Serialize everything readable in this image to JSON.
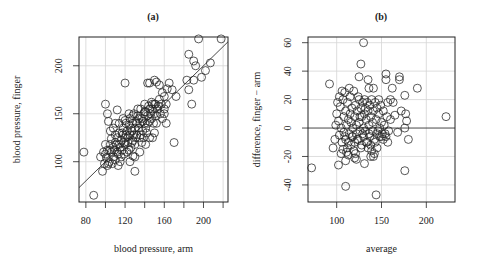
{
  "chart_data": [
    {
      "type": "scatter",
      "title": "(a)",
      "xlabel": "blood pressure, arm",
      "ylabel": "blood pressure, finger",
      "xlim": [
        73,
        225
      ],
      "ylim": [
        58,
        230
      ],
      "xticks": [
        80,
        120,
        160,
        200
      ],
      "xgrid": [
        80,
        100,
        120,
        140,
        160,
        180,
        200,
        220
      ],
      "yticks": [
        100,
        150,
        200
      ],
      "ygrid": [
        100,
        150,
        200
      ],
      "grid": true,
      "reference_line": {
        "type": "identity",
        "slope": 1.0,
        "intercept": 0
      },
      "points": [
        [
          88,
          65
        ],
        [
          78,
          110
        ],
        [
          100,
          160
        ],
        [
          102,
          150
        ],
        [
          103,
          142
        ],
        [
          112,
          154
        ],
        [
          120,
          182
        ],
        [
          143,
          182
        ],
        [
          145,
          182
        ],
        [
          150,
          185
        ],
        [
          152,
          183
        ],
        [
          155,
          180
        ],
        [
          158,
          172
        ],
        [
          160,
          168
        ],
        [
          163,
          176
        ],
        [
          168,
          175
        ],
        [
          165,
          182
        ],
        [
          172,
          168
        ],
        [
          185,
          212
        ],
        [
          190,
          205
        ],
        [
          192,
          200
        ],
        [
          195,
          228
        ],
        [
          207,
          203
        ],
        [
          202,
          195
        ],
        [
          218,
          228
        ],
        [
          198,
          188
        ],
        [
          190,
          185
        ],
        [
          185,
          175
        ],
        [
          183,
          185
        ],
        [
          188,
          160
        ],
        [
          170,
          120
        ],
        [
          130,
          90
        ],
        [
          97,
          90
        ],
        [
          102,
          96
        ],
        [
          113,
          96
        ],
        [
          95,
          105
        ],
        [
          98,
          110
        ],
        [
          100,
          108
        ],
        [
          100,
          118
        ],
        [
          102,
          112
        ],
        [
          104,
          100
        ],
        [
          105,
          118
        ],
        [
          106,
          124
        ],
        [
          108,
          105
        ],
        [
          108,
          115
        ],
        [
          110,
          120
        ],
        [
          110,
          102
        ],
        [
          112,
          110
        ],
        [
          112,
          125
        ],
        [
          114,
          118
        ],
        [
          114,
          130
        ],
        [
          115,
          100
        ],
        [
          116,
          122
        ],
        [
          117,
          112
        ],
        [
          118,
          128
        ],
        [
          118,
          135
        ],
        [
          120,
          118
        ],
        [
          120,
          125
        ],
        [
          121,
          140
        ],
        [
          122,
          110
        ],
        [
          122,
          132
        ],
        [
          123,
          120
        ],
        [
          124,
          138
        ],
        [
          125,
          128
        ],
        [
          125,
          145
        ],
        [
          126,
          115
        ],
        [
          127,
          132
        ],
        [
          128,
          140
        ],
        [
          128,
          122
        ],
        [
          129,
          150
        ],
        [
          130,
          135
        ],
        [
          130,
          118
        ],
        [
          131,
          142
        ],
        [
          132,
          128
        ],
        [
          133,
          148
        ],
        [
          134,
          135
        ],
        [
          135,
          140
        ],
        [
          135,
          125
        ],
        [
          136,
          155
        ],
        [
          137,
          145
        ],
        [
          138,
          132
        ],
        [
          139,
          150
        ],
        [
          140,
          140
        ],
        [
          140,
          160
        ],
        [
          141,
          152
        ],
        [
          142,
          130
        ],
        [
          143,
          148
        ],
        [
          144,
          158
        ],
        [
          145,
          142
        ],
        [
          146,
          150
        ],
        [
          147,
          162
        ],
        [
          148,
          155
        ],
        [
          149,
          140
        ],
        [
          150,
          150
        ],
        [
          151,
          160
        ],
        [
          152,
          148
        ],
        [
          154,
          158
        ],
        [
          155,
          165
        ],
        [
          156,
          150
        ],
        [
          157,
          160
        ],
        [
          160,
          155
        ],
        [
          162,
          160
        ],
        [
          99,
          98
        ],
        [
          101,
          104
        ],
        [
          103,
          98
        ],
        [
          104,
          112
        ],
        [
          106,
          110
        ],
        [
          107,
          98
        ],
        [
          109,
          112
        ],
        [
          110,
          128
        ],
        [
          111,
          118
        ],
        [
          113,
          108
        ],
        [
          115,
          115
        ],
        [
          116,
          105
        ],
        [
          117,
          130
        ],
        [
          119,
          120
        ],
        [
          119,
          108
        ],
        [
          121,
          128
        ],
        [
          123,
          126
        ],
        [
          124,
          112
        ],
        [
          126,
          135
        ],
        [
          127,
          120
        ],
        [
          129,
          128
        ],
        [
          131,
          125
        ],
        [
          132,
          140
        ],
        [
          134,
          145
        ],
        [
          136,
          128
        ],
        [
          138,
          142
        ],
        [
          139,
          125
        ],
        [
          141,
          135
        ],
        [
          143,
          140
        ],
        [
          145,
          155
        ],
        [
          147,
          145
        ],
        [
          150,
          160
        ],
        [
          152,
          140
        ],
        [
          148,
          160
        ],
        [
          153,
          155
        ],
        [
          140,
          152
        ],
        [
          133,
          155
        ],
        [
          128,
          148
        ],
        [
          124,
          150
        ],
        [
          118,
          145
        ],
        [
          120,
          143
        ],
        [
          114,
          140
        ],
        [
          108,
          135
        ],
        [
          105,
          132
        ],
        [
          110,
          140
        ],
        [
          125,
          100
        ],
        [
          130,
          105
        ],
        [
          135,
          110
        ],
        [
          128,
          106
        ],
        [
          137,
          120
        ],
        [
          141,
          118
        ],
        [
          145,
          125
        ],
        [
          158,
          145
        ],
        [
          160,
          150
        ],
        [
          162,
          140
        ],
        [
          150,
          130
        ],
        [
          148,
          125
        ]
      ]
    },
    {
      "type": "scatter",
      "title": "(b)",
      "xlabel": "average",
      "ylabel": "difference, finger − arm",
      "xlim": [
        68,
        232
      ],
      "ylim": [
        -52,
        64
      ],
      "xticks": [
        100,
        150,
        200
      ],
      "xgrid": [
        100,
        150,
        200
      ],
      "yticks": [
        -40,
        -20,
        0,
        20,
        40,
        60
      ],
      "ygrid": [
        -40,
        -20,
        20,
        40,
        60
      ],
      "grid": true,
      "reference_line": {
        "type": "horizontal",
        "y": 0
      },
      "points": [
        [
          130,
          60
        ],
        [
          127,
          45
        ],
        [
          125,
          36
        ],
        [
          135,
          34
        ],
        [
          136,
          28
        ],
        [
          141,
          28
        ],
        [
          92,
          31
        ],
        [
          155,
          38
        ],
        [
          155,
          34
        ],
        [
          162,
          28
        ],
        [
          170,
          36
        ],
        [
          170,
          34
        ],
        [
          190,
          28
        ],
        [
          176,
          23
        ],
        [
          160,
          20
        ],
        [
          157,
          18
        ],
        [
          163,
          18
        ],
        [
          165,
          9
        ],
        [
          172,
          12
        ],
        [
          177,
          10
        ],
        [
          178,
          5
        ],
        [
          176,
          0
        ],
        [
          168,
          -3
        ],
        [
          180,
          -8
        ],
        [
          176,
          -30
        ],
        [
          222,
          8
        ],
        [
          72,
          -28
        ],
        [
          110,
          -41
        ],
        [
          144,
          -47
        ],
        [
          113,
          -19
        ],
        [
          110,
          -23
        ],
        [
          102,
          -26
        ],
        [
          131,
          -25
        ],
        [
          122,
          -22
        ],
        [
          120,
          -21
        ],
        [
          100,
          10
        ],
        [
          102,
          5
        ],
        [
          103,
          -5
        ],
        [
          104,
          15
        ],
        [
          105,
          0
        ],
        [
          106,
          -10
        ],
        [
          107,
          20
        ],
        [
          108,
          8
        ],
        [
          108,
          -3
        ],
        [
          109,
          25
        ],
        [
          110,
          12
        ],
        [
          110,
          -8
        ],
        [
          111,
          2
        ],
        [
          112,
          18
        ],
        [
          112,
          -14
        ],
        [
          113,
          6
        ],
        [
          114,
          -4
        ],
        [
          115,
          22
        ],
        [
          115,
          10
        ],
        [
          116,
          -12
        ],
        [
          117,
          14
        ],
        [
          118,
          0
        ],
        [
          118,
          -6
        ],
        [
          119,
          26
        ],
        [
          120,
          8
        ],
        [
          120,
          -10
        ],
        [
          121,
          16
        ],
        [
          122,
          2
        ],
        [
          122,
          -4
        ],
        [
          123,
          12
        ],
        [
          124,
          -8
        ],
        [
          125,
          20
        ],
        [
          125,
          4
        ],
        [
          126,
          -2
        ],
        [
          127,
          14
        ],
        [
          128,
          -12
        ],
        [
          128,
          8
        ],
        [
          129,
          18
        ],
        [
          130,
          0
        ],
        [
          130,
          -6
        ],
        [
          131,
          10
        ],
        [
          132,
          14
        ],
        [
          132,
          -2
        ],
        [
          133,
          6
        ],
        [
          134,
          18
        ],
        [
          134,
          -10
        ],
        [
          135,
          12
        ],
        [
          136,
          2
        ],
        [
          136,
          -4
        ],
        [
          137,
          16
        ],
        [
          138,
          8
        ],
        [
          138,
          -12
        ],
        [
          139,
          20
        ],
        [
          140,
          4
        ],
        [
          140,
          -2
        ],
        [
          141,
          12
        ],
        [
          142,
          -8
        ],
        [
          143,
          18
        ],
        [
          144,
          6
        ],
        [
          145,
          14
        ],
        [
          146,
          -2
        ],
        [
          147,
          10
        ],
        [
          148,
          -6
        ],
        [
          149,
          16
        ],
        [
          150,
          4
        ],
        [
          151,
          -4
        ],
        [
          152,
          12
        ],
        [
          153,
          2
        ],
        [
          155,
          -6
        ],
        [
          156,
          8
        ],
        [
          158,
          -2
        ],
        [
          160,
          6
        ],
        [
          96,
          -14
        ],
        [
          98,
          -8
        ],
        [
          99,
          2
        ],
        [
          101,
          18
        ],
        [
          103,
          22
        ],
        [
          105,
          -18
        ],
        [
          106,
          26
        ],
        [
          107,
          -15
        ],
        [
          109,
          -6
        ],
        [
          111,
          -17
        ],
        [
          113,
          -10
        ],
        [
          114,
          28
        ],
        [
          116,
          4
        ],
        [
          117,
          -6
        ],
        [
          119,
          -16
        ],
        [
          121,
          -18
        ],
        [
          123,
          -8
        ],
        [
          124,
          22
        ],
        [
          126,
          8
        ],
        [
          127,
          -14
        ],
        [
          129,
          -4
        ],
        [
          131,
          20
        ],
        [
          133,
          -10
        ],
        [
          135,
          -14
        ],
        [
          137,
          -6
        ],
        [
          139,
          -16
        ],
        [
          141,
          -20
        ],
        [
          143,
          -10
        ],
        [
          145,
          -4
        ],
        [
          148,
          0
        ],
        [
          150,
          -6
        ],
        [
          147,
          20
        ],
        [
          152,
          -8
        ],
        [
          154,
          -4
        ],
        [
          157,
          -10
        ],
        [
          145,
          -14
        ],
        [
          142,
          -18
        ],
        [
          138,
          -20
        ]
      ]
    }
  ]
}
